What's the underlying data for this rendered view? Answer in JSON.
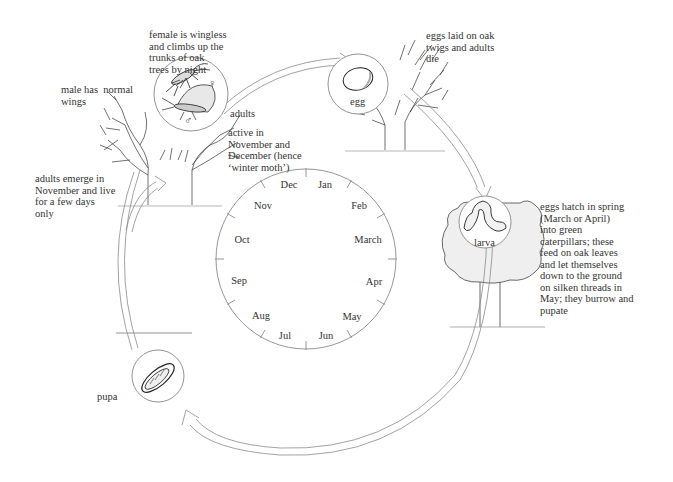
{
  "stages": {
    "adults": {
      "label": "adults",
      "female_symbol": "♀",
      "male_symbol": "♂"
    },
    "egg": {
      "label": "egg"
    },
    "larva": {
      "label": "larva"
    },
    "pupa": {
      "label": "pupa"
    }
  },
  "annotations": {
    "female": "female is wingless\nand climbs up the\ntrunks of oak\ntrees by night",
    "male": "male has  normal\nwings",
    "active": "active in\nNovember and\nDecember (hence\n‘winter moth’)",
    "emerge": "adults emerge in\nNovember and live\nfor a few days\nonly",
    "eggs_laid": "eggs laid on oak\ntwigs and adults\ndie",
    "eggs_hatch": "eggs hatch in spring\n(March or April)\ninto green\ncaterpillars; these\nfeed on oak leaves\nand let themselves\ndown to the ground\non silken threads in\nMay; they burrow and\npupate"
  },
  "calendar": {
    "months": [
      "Jan",
      "Feb",
      "March",
      "Apr",
      "May",
      "Jun",
      "Jul",
      "Aug",
      "Sep",
      "Oct",
      "Nov",
      "Dec"
    ]
  },
  "colors": {
    "line": "#8a8a8a",
    "ink": "#333333",
    "foliage": "#efefef"
  }
}
